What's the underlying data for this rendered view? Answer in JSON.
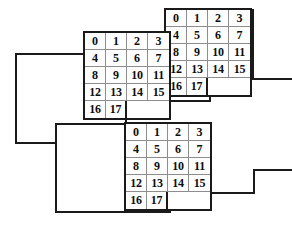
{
  "figure": {
    "ink_color": "#1a1a1a",
    "gridline_color": "#8d8d8d",
    "cell_fill": "#fdfdfd",
    "background": "#ffffff"
  },
  "grids": [
    {
      "name": "top-grid",
      "columns": 4,
      "rows": [
        [
          "0",
          "1",
          "2",
          "3"
        ],
        [
          "4",
          "5",
          "6",
          "7"
        ],
        [
          "8",
          "9",
          "10",
          "11"
        ],
        [
          "12",
          "13",
          "14",
          "15"
        ],
        [
          "16",
          "17"
        ]
      ]
    },
    {
      "name": "middle-grid",
      "columns": 4,
      "rows": [
        [
          "0",
          "1",
          "2",
          "3"
        ],
        [
          "4",
          "5",
          "6",
          "7"
        ],
        [
          "8",
          "9",
          "10",
          "11"
        ],
        [
          "12",
          "13",
          "14",
          "15"
        ],
        [
          "16",
          "17"
        ]
      ]
    },
    {
      "name": "bottom-grid",
      "columns": 4,
      "rows": [
        [
          "0",
          "1",
          "2",
          "3"
        ],
        [
          "4",
          "5",
          "6",
          "7"
        ],
        [
          "8",
          "9",
          "10",
          "11"
        ],
        [
          "12",
          "13",
          "14",
          "15"
        ],
        [
          "16",
          "17"
        ]
      ]
    }
  ],
  "planes": [
    {
      "name": "top-plane-outline",
      "points": "16,54 85,54 85,33 166,33 166,10 253,10 253,101 210,101 210,124 126,124 126,143 16,143"
    },
    {
      "name": "middle-plane-outline",
      "points": "56,124 126,124 126,101 210,101 210,79 297,79 297,170 254,170 254,193 170,193 170,212 56,212"
    }
  ]
}
